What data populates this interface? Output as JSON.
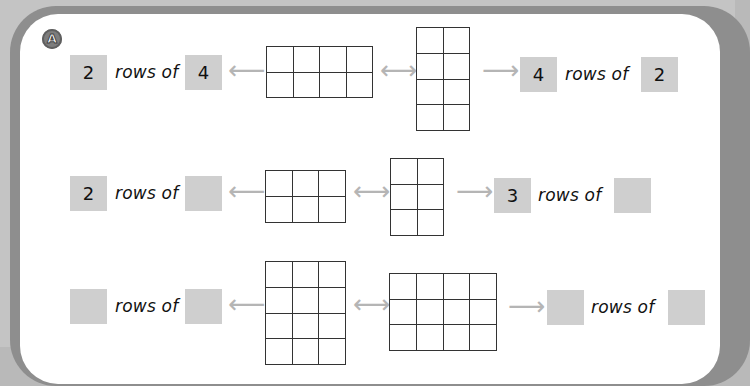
{
  "section_badge": "A",
  "label_text": "rows of",
  "rows": [
    {
      "left": {
        "rows": "2",
        "cols": "4"
      },
      "grid_left": {
        "rows": 2,
        "cols": 4
      },
      "grid_right": {
        "rows": 4,
        "cols": 2
      },
      "right": {
        "rows": "4",
        "cols": "2"
      }
    },
    {
      "left": {
        "rows": "2",
        "cols": ""
      },
      "grid_left": {
        "rows": 2,
        "cols": 3
      },
      "grid_right": {
        "rows": 3,
        "cols": 2
      },
      "right": {
        "rows": "3",
        "cols": ""
      }
    },
    {
      "left": {
        "rows": "",
        "cols": ""
      },
      "grid_left": {
        "rows": 4,
        "cols": 3
      },
      "grid_right": {
        "rows": 3,
        "cols": 4
      },
      "right": {
        "rows": "",
        "cols": ""
      }
    }
  ],
  "arrows": {
    "left": "⟵",
    "both": "⟷",
    "right": "⟶"
  },
  "colors": {
    "answer_box": "#cfcfcf",
    "arrow": "#b5b5b5",
    "frame": "#8e8e8e"
  }
}
